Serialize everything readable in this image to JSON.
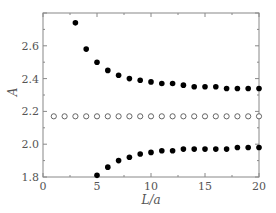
{
  "chart_data": {
    "type": "scatter",
    "title": "",
    "xlabel": "L/a",
    "ylabel": "A",
    "xlim": [
      0,
      20
    ],
    "ylim": [
      1.8,
      2.8
    ],
    "xticks": [
      0,
      5,
      10,
      15,
      20
    ],
    "yticks": [
      1.8,
      2.0,
      2.2,
      2.4,
      2.6
    ],
    "xtick_labels": [
      "0",
      "5",
      "10",
      "15",
      "20"
    ],
    "ytick_labels": [
      "1.8",
      "2.0",
      "2.2",
      "2.4",
      "2.6"
    ],
    "grid": false,
    "legend": null,
    "series": [
      {
        "name": "upper branch",
        "marker": "filled-circle",
        "color": "#000000",
        "x": [
          3,
          4,
          5,
          6,
          7,
          8,
          9,
          10,
          11,
          12,
          13,
          14,
          15,
          16,
          17,
          18,
          19,
          20
        ],
        "y": [
          2.74,
          2.58,
          2.5,
          2.45,
          2.42,
          2.4,
          2.39,
          2.38,
          2.37,
          2.37,
          2.36,
          2.35,
          2.35,
          2.35,
          2.34,
          2.34,
          2.34,
          2.34
        ]
      },
      {
        "name": "middle constant",
        "marker": "open-circle",
        "color": "#555555",
        "x": [
          1,
          2,
          3,
          4,
          5,
          6,
          7,
          8,
          9,
          10,
          11,
          12,
          13,
          14,
          15,
          16,
          17,
          18,
          19,
          20
        ],
        "y": [
          2.17,
          2.17,
          2.17,
          2.17,
          2.17,
          2.17,
          2.17,
          2.17,
          2.17,
          2.17,
          2.17,
          2.17,
          2.17,
          2.17,
          2.17,
          2.17,
          2.17,
          2.17,
          2.17,
          2.17
        ]
      },
      {
        "name": "lower branch",
        "marker": "filled-circle",
        "color": "#000000",
        "x": [
          5,
          6,
          7,
          8,
          9,
          10,
          11,
          12,
          13,
          14,
          15,
          16,
          17,
          18,
          19,
          20
        ],
        "y": [
          1.81,
          1.86,
          1.9,
          1.92,
          1.94,
          1.95,
          1.96,
          1.96,
          1.97,
          1.97,
          1.97,
          1.97,
          1.97,
          1.98,
          1.98,
          1.98
        ]
      }
    ]
  },
  "layout": {
    "plot_left": 43,
    "plot_right": 259,
    "plot_top": 13,
    "plot_bottom": 177,
    "axis_color": "#888888"
  }
}
